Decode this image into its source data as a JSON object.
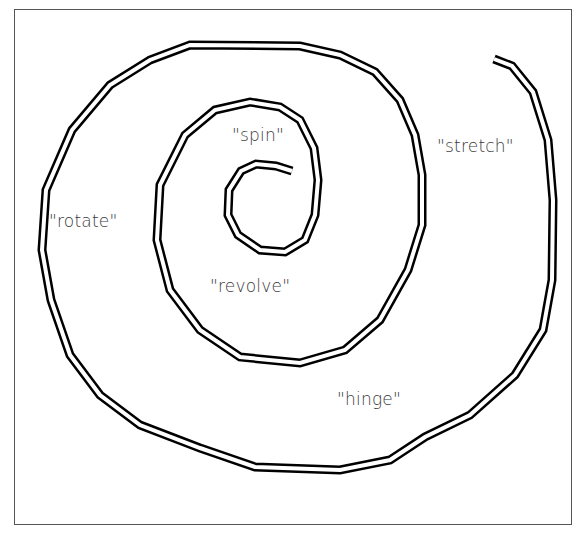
{
  "diagram": {
    "type": "spiral",
    "stroke_style": "double-outline",
    "stroke_color": "#000000",
    "frame_color": "#555555",
    "labels": [
      {
        "id": "spin",
        "text": "\"spin\"",
        "x": 232,
        "y": 125
      },
      {
        "id": "stretch",
        "text": "\"stretch\"",
        "x": 437,
        "y": 136
      },
      {
        "id": "rotate",
        "text": "\"rotate\"",
        "x": 49,
        "y": 211
      },
      {
        "id": "revolve",
        "text": "\"revolve\"",
        "x": 210,
        "y": 276
      },
      {
        "id": "hinge",
        "text": "\"hinge\"",
        "x": 337,
        "y": 389
      }
    ]
  }
}
